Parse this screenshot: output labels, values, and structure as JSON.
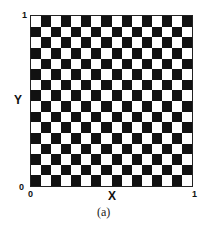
{
  "figure": {
    "caption": "(a)",
    "x_axis": {
      "label": "X",
      "tick_min": "0",
      "tick_max": "1"
    },
    "y_axis": {
      "label": "Y",
      "tick_min": "0",
      "tick_max": "1"
    },
    "board": {
      "rows": 16,
      "cols": 16,
      "top_left_color": "white",
      "dark_color": "#111111",
      "light_color": "#ffffff"
    }
  }
}
